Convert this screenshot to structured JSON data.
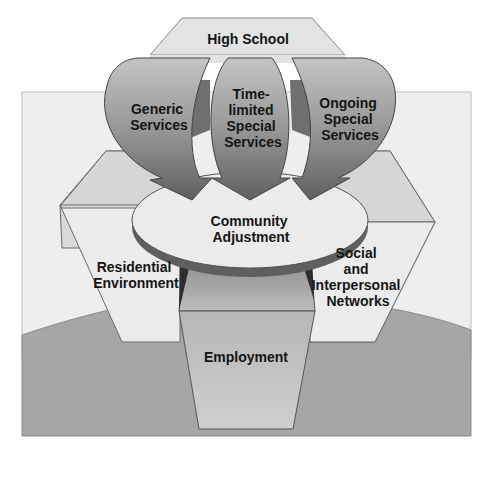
{
  "diagram": {
    "type": "conceptual model",
    "colors": {
      "background_panel": "#eeeeee",
      "ground": "#a6a6a6",
      "hexagon_fill": "#e9e9e9",
      "hexagon_top_face": "#d6d6d6",
      "arrow_gradient_top": "#bdbdbd",
      "arrow_gradient_bottom": "#6a6a6a",
      "disc_top": "#ebebeb",
      "disc_edge": "#6a6a6a",
      "employment_fill": "#c4c4c4",
      "outline": "#555555"
    },
    "nodes": {
      "high_school": "High School",
      "generic_services": "Generic Services",
      "time_limited": [
        "Time-",
        "limited",
        "Special",
        "Services"
      ],
      "ongoing": [
        "Ongoing",
        "Special",
        "Services"
      ],
      "generic": [
        "Generic",
        "Services"
      ],
      "community_adjustment": [
        "Community",
        "Adjustment"
      ],
      "residential": [
        "Residential",
        "Environment"
      ],
      "social": [
        "Social",
        "and",
        "Interpersonal",
        "Networks"
      ],
      "employment": "Employment"
    },
    "edges": [
      {
        "from": "High School",
        "via": "Generic Services",
        "to": "Community Adjustment"
      },
      {
        "from": "High School",
        "via": "Time-limited Special Services",
        "to": "Community Adjustment"
      },
      {
        "from": "High School",
        "via": "Ongoing Special Services",
        "to": "Community Adjustment"
      },
      {
        "from": "Community Adjustment",
        "to": "Residential Environment"
      },
      {
        "from": "Community Adjustment",
        "to": "Social and Interpersonal Networks"
      },
      {
        "from": "Community Adjustment",
        "to": "Employment"
      }
    ]
  }
}
